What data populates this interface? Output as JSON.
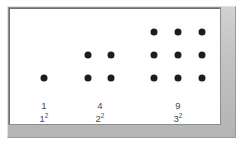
{
  "figure": {
    "background_color": "#ffffff",
    "frame": {
      "name": "beveled-gray-frame",
      "fill_color": "#c6c6c6",
      "inner_background": "#ffffff",
      "border_color": "#8d8d8d"
    },
    "dot": {
      "color": "#1d1d1d",
      "diameter_px": 7
    },
    "groups": [
      {
        "id": "group-1",
        "count_label": "1",
        "square_base": "1",
        "square_exponent": "2",
        "rows": 1,
        "columns": 1,
        "label_center_x": 44,
        "label_top_y": 100,
        "dots": [
          {
            "x": 44,
            "y": 78
          }
        ]
      },
      {
        "id": "group-2",
        "count_label": "4",
        "square_base": "2",
        "square_exponent": "2",
        "rows": 2,
        "columns": 2,
        "label_center_x": 100,
        "label_top_y": 100,
        "dots": [
          {
            "x": 88,
            "y": 55
          },
          {
            "x": 111,
            "y": 55
          },
          {
            "x": 88,
            "y": 78
          },
          {
            "x": 111,
            "y": 78
          }
        ]
      },
      {
        "id": "group-3",
        "count_label": "9",
        "square_base": "3",
        "square_exponent": "2",
        "rows": 3,
        "columns": 3,
        "label_center_x": 178,
        "label_top_y": 100,
        "dots": [
          {
            "x": 154,
            "y": 32
          },
          {
            "x": 178,
            "y": 32
          },
          {
            "x": 202,
            "y": 32
          },
          {
            "x": 154,
            "y": 55
          },
          {
            "x": 178,
            "y": 55
          },
          {
            "x": 202,
            "y": 55
          },
          {
            "x": 154,
            "y": 78
          },
          {
            "x": 178,
            "y": 78
          },
          {
            "x": 202,
            "y": 78
          }
        ]
      }
    ]
  }
}
